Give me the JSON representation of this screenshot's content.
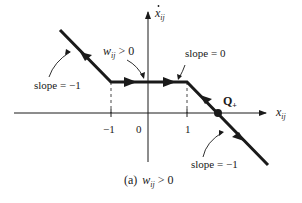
{
  "figure": {
    "caption_prefix": "(a)",
    "caption_var": "w",
    "caption_sub": "ij",
    "caption_rel": " > 0"
  },
  "axes": {
    "y_label": "x",
    "y_label_sub": "ij",
    "x_label": "x",
    "x_label_sub": "ij",
    "ticks": [
      {
        "label": "−1",
        "value": -1
      },
      {
        "label": "0",
        "value": 0
      },
      {
        "label": "1",
        "value": 1
      }
    ]
  },
  "annotations": {
    "slope_left": "slope = −1",
    "slope_flat": "slope = 0",
    "slope_right": "slope = −1",
    "weight_var": "w",
    "weight_sub": "ij",
    "weight_rel": " > 0",
    "equilibrium": "Q",
    "equilibrium_sub": "+"
  },
  "colors": {
    "ink": "#1a1a1a",
    "background": "#ffffff"
  }
}
